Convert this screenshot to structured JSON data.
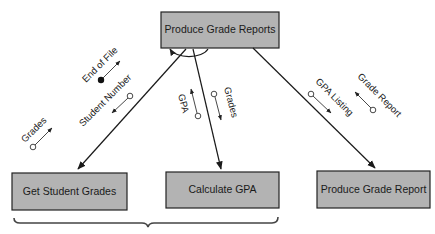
{
  "diagram": {
    "type": "structure-chart",
    "colors": {
      "box_fill": "#b3b3b3",
      "box_border": "#222222",
      "line": "#1a1a1a",
      "background": "#ffffff"
    },
    "modules": {
      "top": {
        "label": "Produce Grade Reports"
      },
      "get_grades": {
        "label": "Get Student Grades"
      },
      "calc_gpa": {
        "label": "Calculate GPA"
      },
      "produce_report": {
        "label": "Produce Grade Report"
      }
    },
    "couples": {
      "end_of_file": {
        "label": "End of File",
        "kind": "control flag",
        "direction": "up"
      },
      "student_number": {
        "label": "Student Number",
        "kind": "data",
        "direction": "down"
      },
      "grades_left": {
        "label": "Grades",
        "kind": "data",
        "direction": "up"
      },
      "gpa": {
        "label": "GPA",
        "kind": "data",
        "direction": "up"
      },
      "grades_mid": {
        "label": "Grades",
        "kind": "data",
        "direction": "down"
      },
      "gpa_listing": {
        "label": "GPA Listing",
        "kind": "data",
        "direction": "down"
      },
      "grade_report": {
        "label": "Grade Report",
        "kind": "data",
        "direction": "up"
      }
    },
    "connections": [
      {
        "from": "Produce Grade Reports",
        "to": "Get Student Grades"
      },
      {
        "from": "Produce Grade Reports",
        "to": "Calculate GPA"
      },
      {
        "from": "Produce Grade Reports",
        "to": "Produce Grade Report"
      }
    ],
    "loop_symbol": "iteration arc beneath top module"
  }
}
